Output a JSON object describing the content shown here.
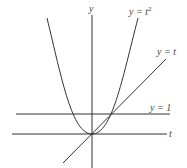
{
  "diagram": {
    "type": "function-plot",
    "colors": {
      "stroke": "#333333",
      "text": "#444444",
      "background": "#ffffff"
    },
    "axes": {
      "horizontal": {
        "label": "t"
      },
      "vertical": {
        "label": "y"
      }
    },
    "curves": [
      {
        "id": "parabola",
        "label_lhs": "y = ",
        "label_var": "t",
        "label_exp": "2",
        "equation": "y = t^2"
      },
      {
        "id": "identity-line",
        "label": "y = t",
        "equation": "y = t"
      },
      {
        "id": "horizontal-line",
        "label": "y = 1",
        "equation": "y = 1"
      }
    ]
  }
}
